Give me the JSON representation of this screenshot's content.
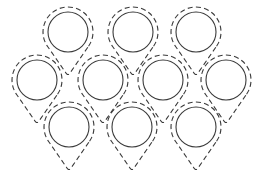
{
  "diagram": {
    "colors": {
      "stroke": "#3a3a3a",
      "background": "#ffffff"
    },
    "rows": [
      {
        "name": "top",
        "count": 3
      },
      {
        "name": "middle",
        "count": 4
      },
      {
        "name": "bottom",
        "count": 3
      }
    ],
    "cells": [
      {
        "id": "top-1",
        "row": "top"
      },
      {
        "id": "top-2",
        "row": "top"
      },
      {
        "id": "top-3",
        "row": "top"
      },
      {
        "id": "middle-1",
        "row": "middle"
      },
      {
        "id": "middle-2",
        "row": "middle"
      },
      {
        "id": "middle-3",
        "row": "middle"
      },
      {
        "id": "middle-4",
        "row": "middle"
      },
      {
        "id": "bottom-1",
        "row": "bottom"
      },
      {
        "id": "bottom-2",
        "row": "bottom"
      },
      {
        "id": "bottom-3",
        "row": "bottom"
      }
    ],
    "inner_shape": "solid-circle",
    "outer_shape": "dashed-teardrop"
  }
}
